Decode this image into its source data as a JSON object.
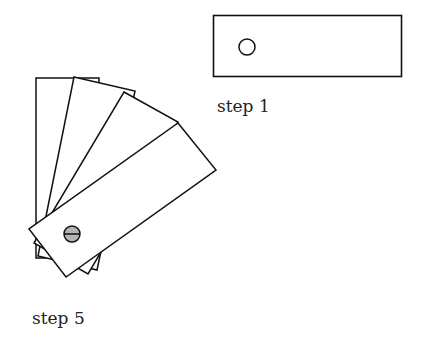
{
  "figure": {
    "step1": {
      "label": "step 1"
    },
    "step5": {
      "label": "step 5"
    },
    "colors": {
      "stroke": "#111111",
      "fill": "#ffffff",
      "screw": "#b5b5b5"
    }
  }
}
